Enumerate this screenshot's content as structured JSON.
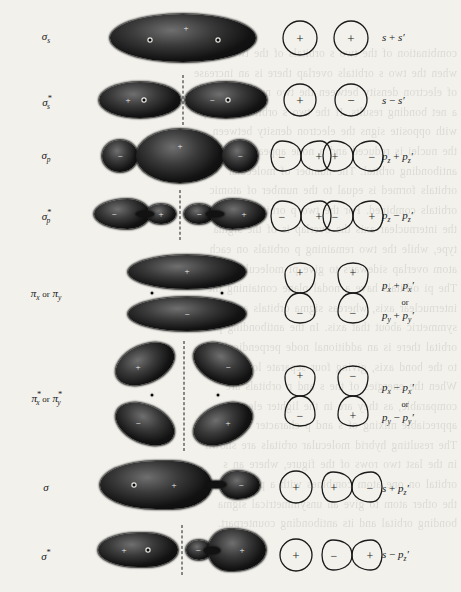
{
  "figure": {
    "type": "molecular-orbital-diagram",
    "background_color": "#f2f1ec",
    "lobe_color": "#121212",
    "columns": [
      "orbital-label",
      "electron-density",
      "schematic-overlap",
      "atomic-orbital-combination"
    ],
    "bleed_through_lines": [
      "combination of the two s orbitals of the two atoms",
      "when the two s orbitals overlap there is an increase",
      "of electron density between the two nuclei so that",
      "a net bonding results. If the two s orbitals overlap",
      "with opposite signs the electron density between",
      "the nuclei is reduced and a node appears; this is the",
      "antibonding orbital. The number of molecular",
      "orbitals formed is equal to the number of atomic",
      "orbitals combined. For the two p orbitals parallel to",
      "the internuclear axis the overlap is of the sigma",
      "type, while the two remaining p orbitals on each",
      "atom overlap sideways to give pi molecular orbitals.",
      "The pi orbitals have a nodal plane containing the",
      "internuclear axis, whereas sigma orbitals are",
      "symmetric about that axis. In the antibonding pi",
      "orbital there is an additional node perpendicular",
      "to the bond axis, giving four separate lobes.",
      "When the energies of the s and p orbitals are",
      "comparable, as they are in the lighter elements,",
      "appreciable mixing of s and p character occurs.",
      "The resulting hybrid molecular orbitals are shown",
      "in the last two rows of the figure, where an s",
      "orbital on one atom combines with a p orbital on",
      "the other atom to give an unsymmetrical sigma",
      "bonding orbital and its antibonding counterpart."
    ]
  },
  "rows": [
    {
      "id": "sigma-s",
      "label_html": "σ",
      "label_sub": "s",
      "label_star": "",
      "label_plain": "σs",
      "formula_lines": [
        "s + s′"
      ],
      "formula_plain": "s + s'",
      "cloud_description": "single large merged ellipse, positive, two nuclei",
      "cloud_signs": [
        "+"
      ],
      "schematic_description": "two circles, signs + and +",
      "schematic_signs": [
        "+",
        "+"
      ]
    },
    {
      "id": "sigma-s-star",
      "label_html": "σ",
      "label_sub": "s",
      "label_star": "*",
      "label_plain": "σ*s",
      "formula_lines": [
        "s − s′"
      ],
      "formula_plain": "s - s'",
      "cloud_description": "two lobes split by a nodal plane, plus and minus",
      "cloud_signs": [
        "+",
        "−"
      ],
      "schematic_description": "two circles, signs + and −",
      "schematic_signs": [
        "+",
        "−"
      ]
    },
    {
      "id": "sigma-p",
      "label_html": "σ",
      "label_sub": "p",
      "label_star": "",
      "label_plain": "σp",
      "formula_lines": [
        "p",
        "z",
        " + p",
        "z",
        "′"
      ],
      "formula_plain": "pz + pz'",
      "cloud_description": "large central positive lobe flanked by two small negative lobes",
      "cloud_signs": [
        "−",
        "+",
        "−"
      ],
      "schematic_description": "four lobes in a row: − + + −",
      "schematic_signs": [
        "−",
        "+",
        "+",
        "−"
      ]
    },
    {
      "id": "sigma-p-star",
      "label_html": "σ",
      "label_sub": "p",
      "label_star": "*",
      "label_plain": "σ*p",
      "formula_lines": [
        "p",
        "z",
        " − p",
        "z",
        "′"
      ],
      "formula_plain": "pz - pz'",
      "cloud_description": "four lobes along the axis separated by a nodal plane",
      "cloud_signs": [
        "−",
        "+",
        "−",
        "+"
      ],
      "schematic_description": "four lobes in a row: − + − +",
      "schematic_signs": [
        "−",
        "+",
        "−",
        "+"
      ]
    },
    {
      "id": "pi-x-y",
      "label_html": "π",
      "label_sub": "x",
      "label_star": "",
      "label_plain": "πx or πy",
      "formula_lines": [
        "p",
        "x",
        " + p",
        "x",
        "′",
        "or",
        "p",
        "y",
        " + p",
        "y",
        "′"
      ],
      "formula_plain": "px + px' or py + py'",
      "cloud_description": "two stacked horizontal lobes above and below the bond axis",
      "cloud_signs": [
        "+",
        "−"
      ],
      "schematic_description": "two vertical figure-eights, each + over −",
      "schematic_signs": [
        "+",
        "−",
        "+",
        "−"
      ]
    },
    {
      "id": "pi-x-y-star",
      "label_html": "π",
      "label_sub": "x",
      "label_star": "*",
      "label_plain": "π*x or π*y",
      "formula_lines": [
        "p",
        "x",
        " − p",
        "x",
        "′",
        "or",
        "p",
        "y",
        " − p",
        "y",
        "′"
      ],
      "formula_plain": "px - px' or py - py'",
      "cloud_description": "four separate lobes in quadrants about two nodal planes",
      "cloud_signs": [
        "+",
        "−",
        "−",
        "+"
      ],
      "schematic_description": "two vertical figure-eights, + over − and − over +",
      "schematic_signs": [
        "+",
        "−",
        "−",
        "+"
      ]
    },
    {
      "id": "sigma-sp",
      "label_html": "σ",
      "label_sub": "",
      "label_star": "",
      "label_plain": "σ",
      "formula_lines": [
        "s + p",
        "z",
        "′"
      ],
      "formula_plain": "s + pz'",
      "cloud_description": "large unsymmetrical positive lobe with small negative lobe",
      "cloud_signs": [
        "+",
        "−"
      ],
      "schematic_description": "circle + next to horizontal figure-eight + −",
      "schematic_signs": [
        "+",
        "+",
        "−"
      ]
    },
    {
      "id": "sigma-sp-star",
      "label_html": "σ",
      "label_sub": "",
      "label_star": "*",
      "label_plain": "σ*",
      "formula_lines": [
        "s − p",
        "z",
        "′"
      ],
      "formula_plain": "s - pz'",
      "cloud_description": "two large positive lobes with a small negative lobe and nodal plane",
      "cloud_signs": [
        "+",
        "−",
        "+"
      ],
      "schematic_description": "circle + next to horizontal figure-eight − +",
      "schematic_signs": [
        "+",
        "−",
        "+"
      ]
    }
  ]
}
